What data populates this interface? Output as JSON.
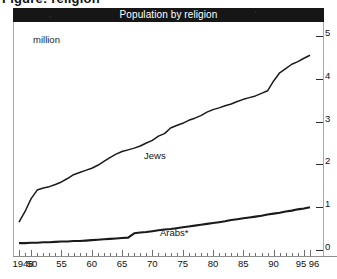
{
  "figure": {
    "heading": "Figure: religion"
  },
  "chart_title": "Population by religion",
  "axis": {
    "unit_label": "million",
    "y_ticks": [
      "0",
      "1",
      "2",
      "3",
      "4",
      "5"
    ],
    "x_major_labels": [
      "1948",
      "50",
      "55",
      "60",
      "65",
      "70",
      "75",
      "80",
      "85",
      "90",
      "95",
      "96"
    ]
  },
  "series_labels": {
    "jews": "Jews",
    "arabs": "Arabs*"
  },
  "chart_data": {
    "type": "line",
    "title": "Population by religion",
    "xlabel": "",
    "ylabel": "million",
    "ylim": [
      0,
      5
    ],
    "xlim": [
      1948,
      1996
    ],
    "grid": false,
    "legend": "inline-annotations",
    "y_axis_position": "right",
    "y_ticks": [
      0,
      1,
      2,
      3,
      4,
      5
    ],
    "x_ticks_major": [
      1948,
      1950,
      1955,
      1960,
      1965,
      1970,
      1975,
      1980,
      1985,
      1990,
      1995,
      1996
    ],
    "x_tick_interval_minor": 1,
    "x": [
      1948,
      1949,
      1950,
      1951,
      1952,
      1953,
      1954,
      1955,
      1956,
      1957,
      1958,
      1959,
      1960,
      1961,
      1962,
      1963,
      1964,
      1965,
      1966,
      1967,
      1968,
      1969,
      1970,
      1971,
      1972,
      1973,
      1974,
      1975,
      1976,
      1977,
      1978,
      1979,
      1980,
      1981,
      1982,
      1983,
      1984,
      1985,
      1986,
      1987,
      1988,
      1989,
      1990,
      1991,
      1992,
      1993,
      1994,
      1995,
      1996
    ],
    "series": [
      {
        "name": "Jews",
        "values": [
          0.65,
          0.9,
          1.2,
          1.4,
          1.45,
          1.48,
          1.53,
          1.59,
          1.67,
          1.76,
          1.81,
          1.86,
          1.91,
          1.98,
          2.07,
          2.16,
          2.24,
          2.3,
          2.34,
          2.38,
          2.43,
          2.5,
          2.56,
          2.66,
          2.72,
          2.85,
          2.91,
          2.96,
          3.03,
          3.08,
          3.14,
          3.22,
          3.28,
          3.32,
          3.37,
          3.41,
          3.47,
          3.52,
          3.56,
          3.6,
          3.66,
          3.72,
          3.95,
          4.14,
          4.24,
          4.34,
          4.4,
          4.48,
          4.55
        ]
      },
      {
        "name": "Arabs*",
        "values": [
          0.16,
          0.16,
          0.17,
          0.17,
          0.18,
          0.18,
          0.19,
          0.2,
          0.2,
          0.21,
          0.21,
          0.22,
          0.23,
          0.24,
          0.25,
          0.26,
          0.27,
          0.28,
          0.29,
          0.39,
          0.41,
          0.42,
          0.44,
          0.46,
          0.48,
          0.49,
          0.51,
          0.53,
          0.55,
          0.57,
          0.59,
          0.61,
          0.63,
          0.65,
          0.67,
          0.7,
          0.72,
          0.74,
          0.76,
          0.78,
          0.8,
          0.83,
          0.85,
          0.87,
          0.9,
          0.92,
          0.95,
          0.97,
          1.0
        ]
      }
    ]
  }
}
